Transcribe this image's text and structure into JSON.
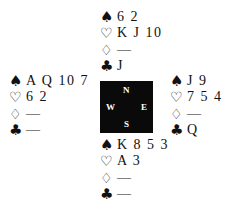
{
  "suits": {
    "spades": "♠",
    "hearts": "♡",
    "diamonds": "♢",
    "clubs": "♣"
  },
  "compass": {
    "north": "N",
    "south": "S",
    "west": "W",
    "east": "E"
  },
  "hands": {
    "north": {
      "spades": "6 2",
      "hearts": "K J 10",
      "diamonds": "—",
      "clubs": "J"
    },
    "west": {
      "spades": "A Q 10 7",
      "hearts": "6 2",
      "diamonds": "—",
      "clubs": "—"
    },
    "east": {
      "spades": "J 9",
      "hearts": "7 5 4",
      "diamonds": "—",
      "clubs": "Q"
    },
    "south": {
      "spades": "K 8 5 3",
      "hearts": "A 3",
      "diamonds": "—",
      "clubs": "—"
    }
  }
}
